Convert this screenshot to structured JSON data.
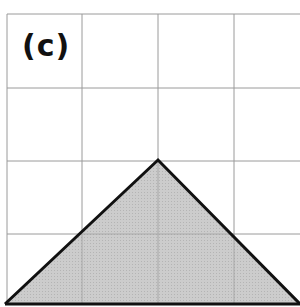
{
  "figure": {
    "label": "(c)",
    "grid": {
      "columns": 4,
      "rows": 4,
      "cell_px": 74,
      "line_color": "#9a9a9a"
    },
    "shape": {
      "type": "triangle",
      "vertices_grid": [
        [
          0,
          4
        ],
        [
          2,
          2
        ],
        [
          4,
          4
        ]
      ],
      "fill": "#c8c8c8",
      "stroke": "#111111"
    }
  }
}
